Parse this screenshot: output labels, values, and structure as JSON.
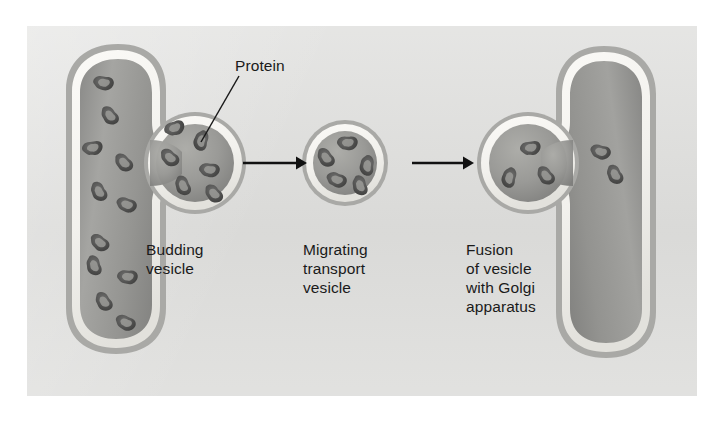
{
  "figure": {
    "kind": "biology-illustration",
    "panel": {
      "background_color": "#dededc",
      "page_color": "#ffffff",
      "x": 27,
      "y": 26,
      "width": 670,
      "height": 370
    },
    "palette": {
      "membrane_white": "#f4f3f0",
      "lumen_gray": "#969694",
      "lumen_gray_light": "#ababa8",
      "lumen_gray_dark": "#7b7b79",
      "outer_shadow": "#a8a8a5",
      "granule_dark": "#4b4b4b",
      "granule_light": "#8f8f8d",
      "arrow_color": "#111111",
      "text_color": "#1a1a1a",
      "leader_line_color": "#1a1a1a"
    }
  },
  "labels": {
    "protein": "Protein",
    "budding_vesicle": "Budding\nvesicle",
    "migrating_transport_vesicle": "Migrating\ntransport\nvesicle",
    "fusion_with_golgi": "Fusion\nof vesicle\nwith Golgi\napparatus"
  },
  "structures": [
    {
      "id": "er-cisterna-left",
      "name": "Endoplasmic reticulum cisterna",
      "granule_count": 11
    },
    {
      "id": "budding-vesicle",
      "name": "Budding vesicle",
      "center": [
        195,
        163
      ],
      "radius": 45,
      "granule_count": 6
    },
    {
      "id": "migrating-vesicle",
      "name": "Migrating transport vesicle",
      "center": [
        345,
        163
      ],
      "radius": 39,
      "granule_count": 5
    },
    {
      "id": "fusing-vesicle",
      "name": "Fusing vesicle",
      "center": [
        528,
        163
      ],
      "radius": 45,
      "granule_count": 3
    },
    {
      "id": "golgi-cisterna-right",
      "name": "Golgi apparatus cisterna",
      "granule_count": 2
    }
  ],
  "arrows": [
    {
      "id": "arrow-1",
      "from": [
        243,
        163
      ],
      "to": [
        303,
        163
      ],
      "direction": "right"
    },
    {
      "id": "arrow-2",
      "from": [
        412,
        163
      ],
      "to": [
        470,
        163
      ],
      "direction": "right"
    }
  ],
  "leader_line": {
    "id": "protein-leader",
    "from": [
      238,
      76
    ],
    "to": [
      201,
      141
    ]
  }
}
